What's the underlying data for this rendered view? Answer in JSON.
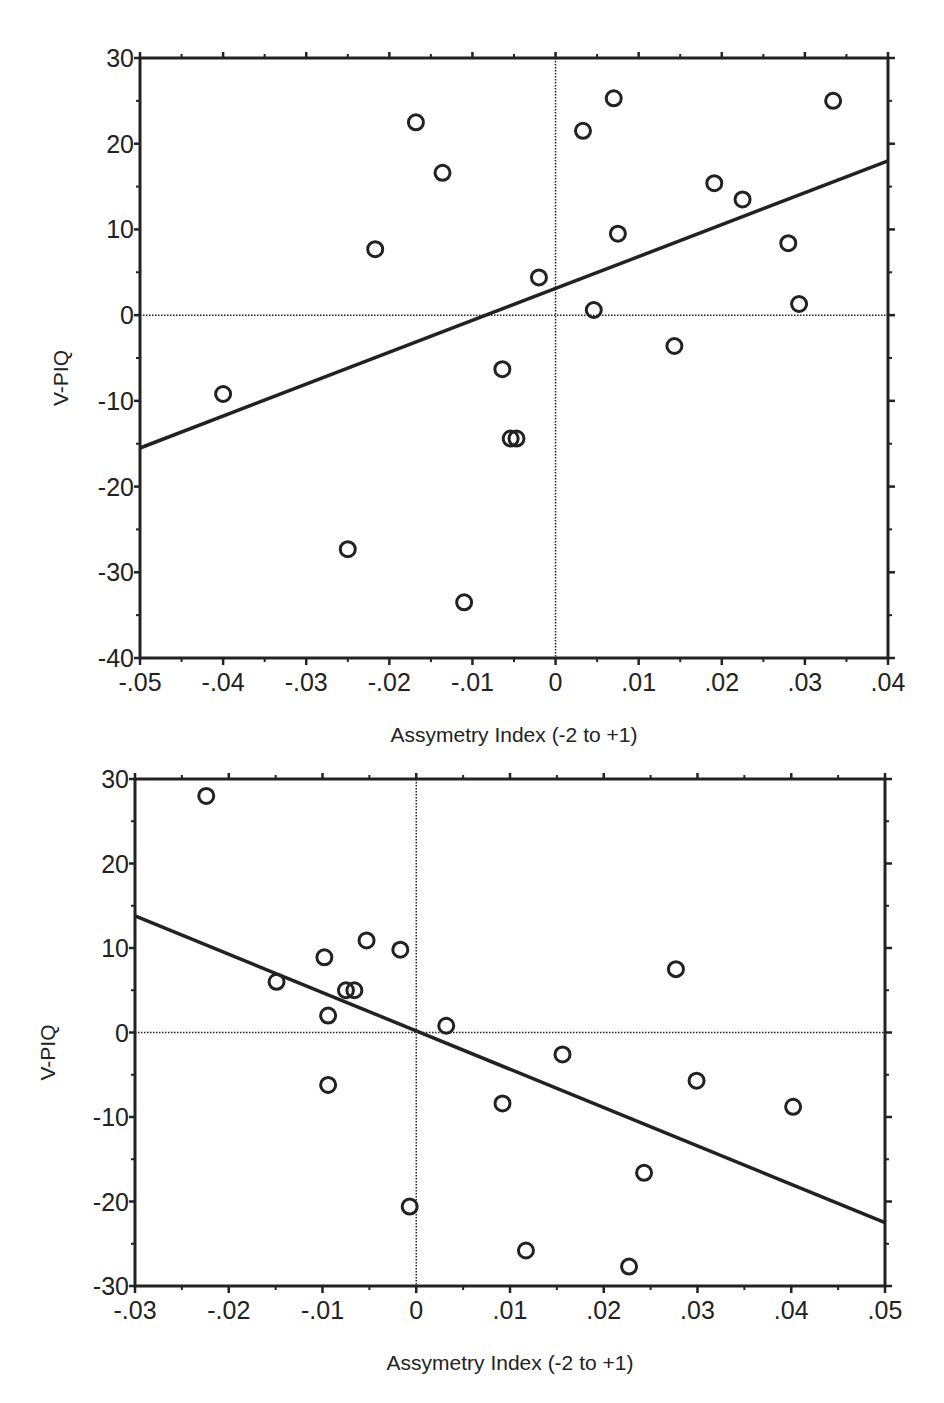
{
  "chart_data": [
    {
      "type": "scatter",
      "title": "",
      "xlabel": "Assymetry Index (-2 to +1)",
      "ylabel": "V-PIQ",
      "xlim": [
        -0.05,
        0.04
      ],
      "ylim": [
        -40,
        30
      ],
      "x_ticks": [
        -0.05,
        -0.04,
        -0.03,
        -0.02,
        -0.01,
        0,
        0.01,
        0.02,
        0.03,
        0.04
      ],
      "x_tick_labels": [
        "-.05",
        "-.04",
        "-.03",
        "-.02",
        "-.01",
        "0",
        ".01",
        ".02",
        ".03",
        ".04"
      ],
      "y_ticks": [
        30,
        20,
        10,
        0,
        -10,
        -20,
        -30,
        -40
      ],
      "y_tick_labels": [
        "30",
        "20",
        "10",
        "0",
        "-10",
        "-20",
        "-30",
        "-40"
      ],
      "grid": false,
      "reference_lines": {
        "x0": true,
        "y0": true
      },
      "marker": "open-circle",
      "points": [
        {
          "x": -0.04,
          "y": -9.2
        },
        {
          "x": -0.025,
          "y": -27.3
        },
        {
          "x": -0.0217,
          "y": 7.7
        },
        {
          "x": -0.0168,
          "y": 22.5
        },
        {
          "x": -0.0136,
          "y": 16.6
        },
        {
          "x": -0.011,
          "y": -33.5
        },
        {
          "x": -0.0064,
          "y": -6.3
        },
        {
          "x": -0.0054,
          "y": -14.4
        },
        {
          "x": -0.0047,
          "y": -14.4
        },
        {
          "x": -0.002,
          "y": 4.4
        },
        {
          "x": 0.0033,
          "y": 21.5
        },
        {
          "x": 0.0046,
          "y": 0.6
        },
        {
          "x": 0.007,
          "y": 25.3
        },
        {
          "x": 0.0075,
          "y": 9.5
        },
        {
          "x": 0.0143,
          "y": -3.6
        },
        {
          "x": 0.0191,
          "y": 15.4
        },
        {
          "x": 0.0225,
          "y": 13.5
        },
        {
          "x": 0.028,
          "y": 8.4
        },
        {
          "x": 0.0293,
          "y": 1.3
        },
        {
          "x": 0.0334,
          "y": 25.0
        }
      ],
      "fit_line": {
        "x1": -0.05,
        "y1": -15.5,
        "x2": 0.04,
        "y2": 18.0
      }
    },
    {
      "type": "scatter",
      "title": "",
      "xlabel": "Assymetry Index (-2 to +1)",
      "ylabel": "V-PIQ",
      "xlim": [
        -0.03,
        0.05
      ],
      "ylim": [
        -30,
        30
      ],
      "x_ticks": [
        -0.03,
        -0.02,
        -0.01,
        0,
        0.01,
        0.02,
        0.03,
        0.04,
        0.05
      ],
      "x_tick_labels": [
        "-.03",
        "-.02",
        "-.01",
        "0",
        ".01",
        ".02",
        ".03",
        ".04",
        ".05"
      ],
      "y_ticks": [
        30,
        20,
        10,
        0,
        -10,
        -20,
        -30
      ],
      "y_tick_labels": [
        "30",
        "20",
        "10",
        "0",
        "-10",
        "-20",
        "-30"
      ],
      "grid": false,
      "reference_lines": {
        "x0": true,
        "y0": true
      },
      "marker": "open-circle",
      "points": [
        {
          "x": -0.0224,
          "y": 28.0
        },
        {
          "x": -0.0149,
          "y": 6.0
        },
        {
          "x": -0.0098,
          "y": 8.9
        },
        {
          "x": -0.0094,
          "y": 2.0
        },
        {
          "x": -0.0094,
          "y": -6.2
        },
        {
          "x": -0.0075,
          "y": 5.0
        },
        {
          "x": -0.0066,
          "y": 5.0
        },
        {
          "x": -0.0053,
          "y": 10.9
        },
        {
          "x": -0.0017,
          "y": 9.8
        },
        {
          "x": -0.0007,
          "y": -20.6
        },
        {
          "x": 0.0032,
          "y": 0.8
        },
        {
          "x": 0.0092,
          "y": -8.4
        },
        {
          "x": 0.0117,
          "y": -25.8
        },
        {
          "x": 0.0156,
          "y": -2.6
        },
        {
          "x": 0.0227,
          "y": -27.7
        },
        {
          "x": 0.0243,
          "y": -16.6
        },
        {
          "x": 0.0277,
          "y": 7.5
        },
        {
          "x": 0.0299,
          "y": -5.7
        },
        {
          "x": 0.0402,
          "y": -8.8
        }
      ],
      "fit_line": {
        "x1": -0.03,
        "y1": 13.8,
        "x2": 0.05,
        "y2": -22.5
      }
    }
  ],
  "charts": [
    {
      "xlabel": "Assymetry Index (-2 to +1)",
      "ylabel": "V-PIQ"
    },
    {
      "xlabel": "Assymetry Index (-2 to +1)",
      "ylabel": "V-PIQ"
    }
  ],
  "colors": {
    "ink": "#222222",
    "background": "#ffffff"
  }
}
